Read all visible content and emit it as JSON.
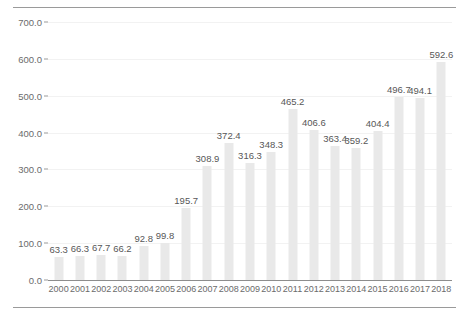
{
  "chart_data": {
    "type": "bar",
    "title": "",
    "subtitle": "",
    "xlabel": "",
    "ylabel": "",
    "categories": [
      "2000",
      "2001",
      "2002",
      "2003",
      "2004",
      "2005",
      "2006",
      "2007",
      "2008",
      "2009",
      "2010",
      "2011",
      "2012",
      "2013",
      "2014",
      "2015",
      "2016",
      "2017",
      "2018"
    ],
    "values": [
      63.3,
      66.3,
      67.7,
      66.2,
      92.8,
      99.8,
      195.7,
      308.9,
      372.4,
      316.3,
      348.3,
      465.2,
      406.6,
      363.4,
      359.2,
      404.4,
      496.7,
      494.1,
      592.6
    ],
    "data_labels": [
      "63.3",
      "66.3",
      "67.7",
      "66.2",
      "92.8",
      "99.8",
      "195.7",
      "308.9",
      "372.4",
      "316.3",
      "348.3",
      "465.2",
      "406.6",
      "363.4",
      "359.2",
      "404.4",
      "496.7",
      "494.1",
      "592.6"
    ],
    "ylim": [
      0,
      700
    ],
    "ytick_values": [
      0,
      100,
      200,
      300,
      400,
      500,
      600,
      700
    ],
    "ytick_labels": [
      "0.0",
      "100.0",
      "200.0",
      "300.0",
      "400.0",
      "500.0",
      "600.0",
      "700.0"
    ],
    "grid": true,
    "legend": [],
    "legend_position": "none",
    "series_color": "#e9e9e9",
    "grid_color": "#f2f2f2",
    "axis_color": "#8d8d8d",
    "label_color": "#575757",
    "tick_color": "#6b6b6b",
    "rule_color": "#9a9a9a"
  }
}
